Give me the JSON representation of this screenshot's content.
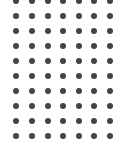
{
  "dot_grid": {
    "columns": 7,
    "rows": 10,
    "col_x": [
      16,
      32,
      48,
      63,
      79,
      94,
      110
    ],
    "row_y": [
      1,
      16,
      31,
      46,
      61,
      76,
      91,
      106,
      121,
      136
    ],
    "dot_diameter": 6,
    "dot_color": "#444444",
    "background": "#ffffff"
  }
}
